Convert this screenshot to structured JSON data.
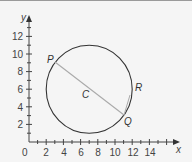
{
  "diagram": {
    "type": "coordinate-geometry",
    "axes": {
      "x_label": "x",
      "y_label": "y",
      "origin_label": "0",
      "x_ticks": [
        "2",
        "4",
        "6",
        "8",
        "10",
        "12",
        "14"
      ],
      "y_ticks": [
        "2",
        "4",
        "6",
        "8",
        "10",
        "12"
      ],
      "x_range": [
        0,
        16
      ],
      "y_range": [
        0,
        14
      ]
    },
    "circle": {
      "center": [
        7,
        6
      ],
      "radius": 5,
      "stroke": "#333333"
    },
    "points": {
      "P": {
        "label": "P",
        "coords": [
          3,
          9
        ]
      },
      "Q": {
        "label": "Q",
        "coords": [
          11,
          3
        ]
      },
      "C": {
        "label": "C",
        "coords": [
          7,
          6
        ]
      },
      "R": {
        "label": "R",
        "coords": [
          12,
          6.5
        ]
      }
    },
    "segments": [
      {
        "from": "P",
        "to": "Q",
        "color": "#aaaaaa"
      }
    ],
    "colors": {
      "background": "#f5f5f5",
      "axis": "#444444",
      "circle": "#333333",
      "chord": "#aaaaaa"
    }
  }
}
